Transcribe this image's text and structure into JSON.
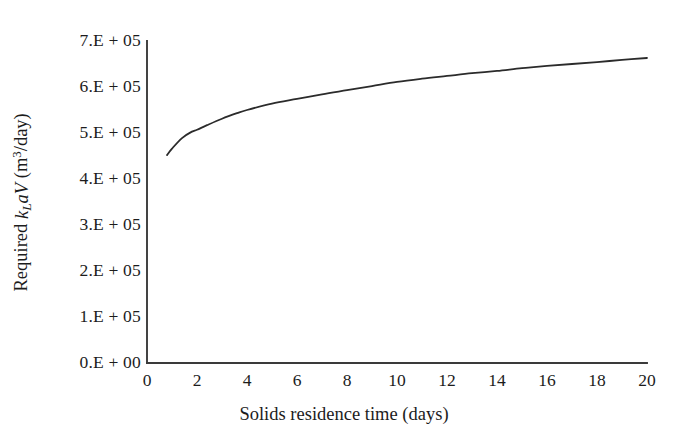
{
  "chart_data": {
    "type": "line",
    "title": "",
    "xlabel": "Solids residence time (days)",
    "ylabel_parts": {
      "prefix": "Required ",
      "k": "k",
      "k_sub": "L",
      "a": "a",
      "V": "V",
      "units_open": " (m",
      "units_exp": "3",
      "units_close": "/day)"
    },
    "ylabel_plain": "Required kLaV (m3/day)",
    "xlim": [
      0,
      20
    ],
    "ylim": [
      0,
      700000
    ],
    "xticks": [
      "0",
      "2",
      "4",
      "6",
      "8",
      "10",
      "12",
      "14",
      "16",
      "18",
      "20"
    ],
    "xtick_values": [
      0,
      2,
      4,
      6,
      8,
      10,
      12,
      14,
      16,
      18,
      20
    ],
    "yticks": [
      "0.E + 00",
      "1.E + 05",
      "2.E + 05",
      "3.E + 05",
      "4.E + 05",
      "5.E + 05",
      "6.E + 05",
      "7.E + 05"
    ],
    "ytick_values": [
      0,
      100000,
      200000,
      300000,
      400000,
      500000,
      600000,
      700000
    ],
    "grid": false,
    "legend": null,
    "series": [
      {
        "name": "Required kLaV",
        "color": "#2b2b2b",
        "line_width": 1.8,
        "x": [
          0.8,
          1.0,
          1.4,
          1.8,
          2.0,
          2.4,
          3.0,
          3.6,
          4.0,
          5.0,
          6.0,
          7.0,
          8.0,
          9.0,
          10.0,
          11.0,
          12.0,
          13.0,
          14.0,
          15.0,
          16.0,
          17.0,
          18.0,
          19.0,
          20.0
        ],
        "y": [
          452000,
          466000,
          489000,
          503000,
          507000,
          517000,
          531000,
          543000,
          550000,
          564000,
          574000,
          584000,
          593000,
          602000,
          611000,
          618000,
          624000,
          630000,
          635000,
          641000,
          646000,
          650000,
          654000,
          659000,
          663000
        ]
      }
    ],
    "axis_color": "#3a3a3a",
    "background": "#ffffff"
  },
  "geometry": {
    "plot_left_px": 147,
    "plot_right_px": 647,
    "plot_bottom_px": 363,
    "plot_top_px": 41
  }
}
